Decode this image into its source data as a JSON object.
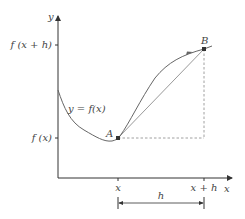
{
  "diagram": {
    "type": "function-difference-quotient",
    "axes": {
      "x_label": "x",
      "y_label": "y"
    },
    "y_ticks": [
      {
        "label": "f (x + h)",
        "y": 45
      },
      {
        "label": "f (x)",
        "y": 138
      }
    ],
    "x_ticks": [
      {
        "label": "x",
        "x": 118
      },
      {
        "label": "x + h",
        "x": 204
      }
    ],
    "curve_label": "y = f(x)",
    "points": [
      {
        "name": "A",
        "label": "A"
      },
      {
        "name": "B",
        "label": "B"
      }
    ],
    "interval_label": "h",
    "colors": {
      "axis": "#333333",
      "curve": "#666666",
      "secant": "#999999",
      "dashed": "#888888",
      "point": "#333333",
      "text": "#444444"
    }
  }
}
